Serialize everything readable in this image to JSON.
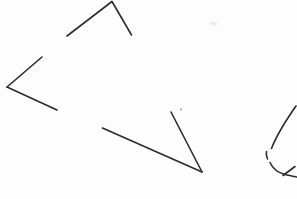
{
  "canvas": {
    "width": 297,
    "height": 199,
    "background": "#fdfdfd",
    "stroke_color": "#2b2b2b",
    "stroke_width": 1.6
  },
  "sketch": {
    "kind": "hand-drawn line doodle",
    "strokes": [
      {
        "name": "peak-left-arm",
        "d": "M 112,1.5 L 67,36"
      },
      {
        "name": "peak-right-arm",
        "d": "M 112,1.5 L 131.5,35"
      },
      {
        "name": "angle-upper-arm",
        "d": "M 42,57 L 7,87"
      },
      {
        "name": "angle-lower-arm",
        "d": "M 7,87 L 57,110"
      },
      {
        "name": "check-long-arm",
        "d": "M 102.5,128 L 202,172"
      },
      {
        "name": "check-steep-arm",
        "d": "M 171,112 L 202,172"
      },
      {
        "name": "curve-upper-segment",
        "d": "M 296,106 C 289,116 277,134 271.5,148.5"
      },
      {
        "name": "curve-dash-segment",
        "d": "M 266.5,151.5 C 266,154 266.3,156.5 267.5,159"
      },
      {
        "name": "curve-lower-segment",
        "d": "M 270,162.5 C 272.5,168 277,172.5 285,174.5 C 288.5,175.4 292.5,176.2 296.5,177"
      },
      {
        "name": "curve-end-tick",
        "d": "M 283,175.5 L 295,166.5"
      }
    ],
    "faint_marks": [
      {
        "name": "faint-smudge-top",
        "cx": 213.5,
        "cy": 23.5,
        "rx": 4,
        "ry": 1.8,
        "color": "#ececec"
      },
      {
        "name": "faint-dot-middle",
        "cx": 181,
        "cy": 109.5,
        "rx": 1.1,
        "ry": 1.1,
        "color": "#aaaaaa"
      }
    ]
  }
}
